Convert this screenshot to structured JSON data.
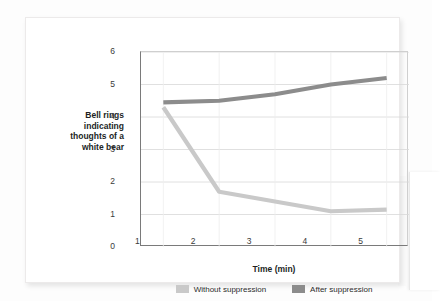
{
  "chart_data": {
    "type": "line",
    "title": "",
    "xlabel": "Time (min)",
    "ylabel": "Bell rings indicating thoughts of a white bear",
    "x": [
      1,
      2,
      3,
      4,
      5
    ],
    "xtick_labels": [
      "1",
      "2",
      "3",
      "4",
      "5"
    ],
    "ytick_labels": [
      "0",
      "1",
      "2",
      "3",
      "4",
      "5",
      "6"
    ],
    "xlim": [
      0.6,
      5.4
    ],
    "ylim": [
      0,
      6
    ],
    "grid": "horizontal",
    "legend_position": "bottom",
    "series": [
      {
        "name": "Without suppression",
        "color": "#c9c9c9",
        "values": [
          4.3,
          1.7,
          1.4,
          1.1,
          1.15
        ]
      },
      {
        "name": "After suppression",
        "color": "#8c8c8c",
        "values": [
          4.45,
          4.5,
          4.7,
          5.0,
          5.2
        ]
      }
    ]
  },
  "legend": {
    "items": [
      {
        "label": "Without suppression",
        "color": "#c9c9c9"
      },
      {
        "label": "After suppression",
        "color": "#8c8c8c"
      }
    ]
  },
  "colors": {
    "axis": "#7a7a7a",
    "grid": "#d8d8d8",
    "text": "#221f1f",
    "card": "#ffffff"
  }
}
